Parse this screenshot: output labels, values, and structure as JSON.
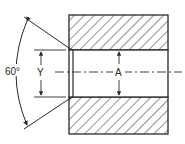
{
  "diagram": {
    "type": "technical-drawing",
    "labels": {
      "angle": "60°",
      "dim_y": "Y",
      "dim_a": "A"
    },
    "colors": {
      "line": "#2a2a2a",
      "background": "#ffffff"
    }
  }
}
